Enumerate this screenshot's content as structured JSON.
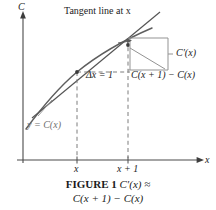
{
  "figure": {
    "axes": {
      "y_axis_label": "C",
      "x_axis_label": "x"
    },
    "annotations": {
      "tangent_line": "Tangent line at x",
      "derivative_bracket": "C′(x)",
      "delta_x": "Δx = 1",
      "difference": "C(x + 1) − C(x)",
      "curve_label": "y = C(x)"
    },
    "ticks": {
      "x_first": "x",
      "x_second": "x + 1"
    },
    "caption": {
      "figure_number": "FIGURE 1",
      "line1_math": "C′(x) ≈",
      "line2": "C(x + 1) − C(x)"
    },
    "colors": {
      "axis": "#4a4a4a",
      "curve": "#5a5a5a",
      "tangent": "#555555",
      "dashed": "#7a7a7a",
      "bracket": "#8a8a8a",
      "text": "#232323"
    },
    "geometry": {
      "y_axis_x": 23,
      "x_axis_y": 160,
      "x_tick_1": 77,
      "x_tick_2": 128,
      "point_x_y": 72,
      "point_x1_y": 45
    }
  }
}
